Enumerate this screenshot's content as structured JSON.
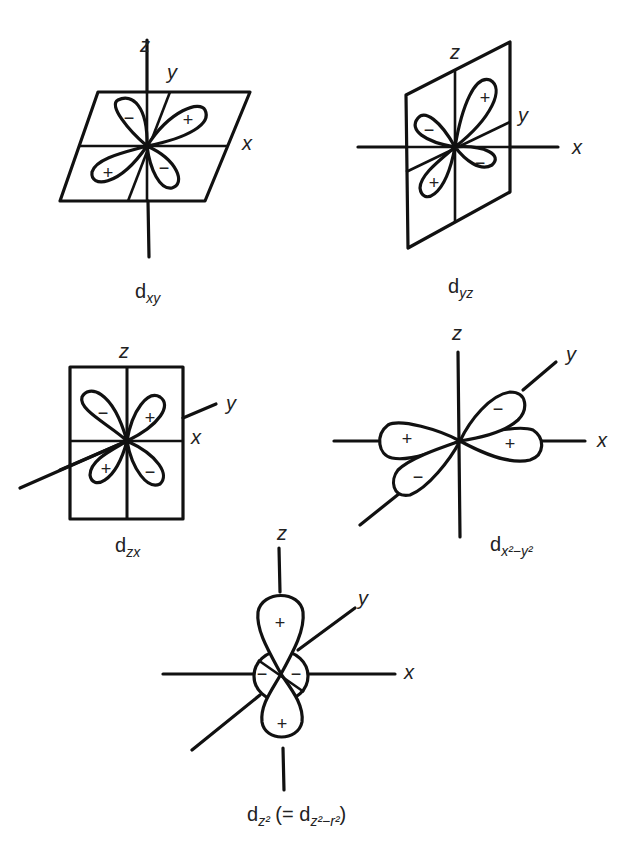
{
  "figure": {
    "panels": [
      {
        "id": "dxy",
        "caption_main": "d",
        "caption_sub": "xy",
        "axes": {
          "z": "z",
          "y": "y",
          "x": "x"
        },
        "lobe_signs": [
          "−",
          "+",
          "+",
          "−"
        ]
      },
      {
        "id": "dyz",
        "caption_main": "d",
        "caption_sub": "yz",
        "axes": {
          "z": "z",
          "y": "y",
          "x": "x"
        },
        "lobe_signs": [
          "+",
          "−",
          "+",
          "−"
        ]
      },
      {
        "id": "dzx",
        "caption_main": "d",
        "caption_sub": "zx",
        "axes": {
          "z": "z",
          "y": "y",
          "x": "x"
        },
        "lobe_signs": [
          "−",
          "+",
          "+",
          "−"
        ]
      },
      {
        "id": "dx2-y2",
        "caption_main": "d",
        "caption_sub": "x²−y²",
        "axes": {
          "z": "z",
          "y": "y",
          "x": "x"
        },
        "lobe_signs": [
          "−",
          "+",
          "+",
          "−"
        ]
      },
      {
        "id": "dz2",
        "caption_main": "d",
        "caption_sub": "z²",
        "caption_extra": "(= d",
        "caption_extra_sub": "z²−r²",
        "caption_close": ")",
        "axes": {
          "z": "z",
          "y": "y",
          "x": "x"
        },
        "lobe_signs": [
          "+",
          "−",
          "−",
          "+"
        ]
      }
    ]
  }
}
